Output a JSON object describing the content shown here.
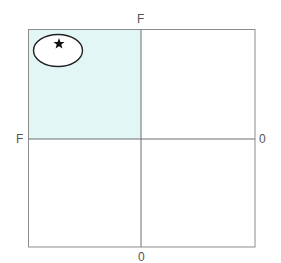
{
  "diagram": {
    "type": "quadrant-grid",
    "axis_labels": {
      "top": "F",
      "left": "F",
      "right": "0",
      "bottom": "0"
    },
    "highlighted_quadrant": "top-left",
    "colors": {
      "highlight_fill": "#e3f6f6",
      "grid_line": "#8c8c8c",
      "ellipse_stroke": "#222222",
      "ellipse_fill": "#ffffff",
      "star_fill": "#111111",
      "label_text": "#555555"
    },
    "marker": {
      "shape": "star",
      "enclosed_by": "ellipse",
      "quadrant": "top-left"
    }
  }
}
